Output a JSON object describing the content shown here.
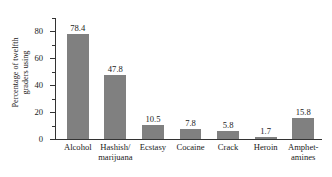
{
  "chart_data": {
    "type": "bar",
    "title": "",
    "xlabel": "",
    "ylabel": "Percentage of twelfth graders using",
    "ylabel_lines": [
      "Percentage of twelfth",
      "graders using"
    ],
    "categories": [
      "Alcohol",
      "Hashish/ marijuana",
      "Ecstasy",
      "Cocaine",
      "Crack",
      "Heroin",
      "Amphet- amines"
    ],
    "category_lines": [
      [
        "Alcohol"
      ],
      [
        "Hashish/",
        "marijuana"
      ],
      [
        "Ecstasy"
      ],
      [
        "Cocaine"
      ],
      [
        "Crack"
      ],
      [
        "Heroin"
      ],
      [
        "Amphet-",
        "amines"
      ]
    ],
    "values": [
      78.4,
      47.8,
      10.5,
      7.8,
      5.8,
      1.7,
      15.8
    ],
    "value_labels": [
      "78.4",
      "47.8",
      "10.5",
      "7.8",
      "5.8",
      "1.7",
      "15.8"
    ],
    "ylim": [
      0,
      90
    ],
    "ytick_major": [
      0,
      20,
      40,
      60,
      80
    ],
    "ytick_major_labels": [
      "0",
      "20",
      "40",
      "60",
      "80"
    ],
    "ytick_minor": [
      10,
      30,
      50,
      70,
      90
    ],
    "grid": false,
    "legend": false,
    "bar_color": "#808080",
    "axis_color": "#333333",
    "text_color": "#1a1a1a",
    "background_color": "#ffffff"
  }
}
